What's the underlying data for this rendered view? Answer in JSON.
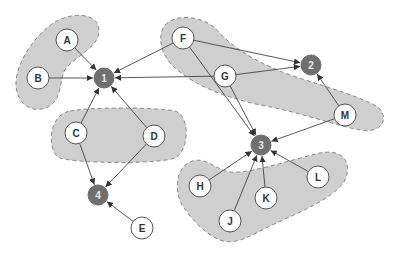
{
  "colors": {
    "group_fill": "#cfcfcf",
    "group_stroke": "#8a8a8a",
    "hub_fill": "#6f6f6f",
    "hub_text": "#e8e8e8",
    "leaf_fill": "#ffffff",
    "leaf_stroke": "#555555",
    "leaf_text": "#333333",
    "edge": "#444444"
  },
  "hubs": [
    {
      "id": "1",
      "label": "1",
      "x": 104,
      "y": 78
    },
    {
      "id": "2",
      "label": "2",
      "x": 311,
      "y": 65
    },
    {
      "id": "3",
      "label": "3",
      "x": 261,
      "y": 145
    },
    {
      "id": "4",
      "label": "4",
      "x": 98,
      "y": 195
    }
  ],
  "leaves": [
    {
      "id": "A",
      "label": "A",
      "x": 67,
      "y": 40
    },
    {
      "id": "B",
      "label": "B",
      "x": 38,
      "y": 78
    },
    {
      "id": "C",
      "label": "C",
      "x": 76,
      "y": 133
    },
    {
      "id": "D",
      "label": "D",
      "x": 154,
      "y": 136
    },
    {
      "id": "E",
      "label": "E",
      "x": 142,
      "y": 228
    },
    {
      "id": "F",
      "label": "F",
      "x": 183,
      "y": 38
    },
    {
      "id": "G",
      "label": "G",
      "x": 225,
      "y": 76
    },
    {
      "id": "M",
      "label": "M",
      "x": 345,
      "y": 115
    },
    {
      "id": "H",
      "label": "H",
      "x": 200,
      "y": 186
    },
    {
      "id": "J",
      "label": "J",
      "x": 230,
      "y": 221
    },
    {
      "id": "K",
      "label": "K",
      "x": 266,
      "y": 198
    },
    {
      "id": "L",
      "label": "L",
      "x": 318,
      "y": 177
    }
  ],
  "edges": [
    [
      "A",
      "1"
    ],
    [
      "B",
      "1"
    ],
    [
      "F",
      "1"
    ],
    [
      "G",
      "1"
    ],
    [
      "C",
      "1"
    ],
    [
      "D",
      "1"
    ],
    [
      "F",
      "2"
    ],
    [
      "G",
      "2"
    ],
    [
      "M",
      "2"
    ],
    [
      "F",
      "3"
    ],
    [
      "G",
      "3"
    ],
    [
      "M",
      "3"
    ],
    [
      "H",
      "3"
    ],
    [
      "J",
      "3"
    ],
    [
      "K",
      "3"
    ],
    [
      "L",
      "3"
    ],
    [
      "C",
      "4"
    ],
    [
      "D",
      "4"
    ],
    [
      "E",
      "4"
    ]
  ],
  "groups": [
    {
      "name": "group-ab",
      "members": [
        "A",
        "B"
      ]
    },
    {
      "name": "group-cd",
      "members": [
        "C",
        "D"
      ]
    },
    {
      "name": "group-fgm",
      "members": [
        "F",
        "G",
        "M"
      ]
    },
    {
      "name": "group-hjkl",
      "members": [
        "H",
        "J",
        "K",
        "L"
      ]
    }
  ]
}
